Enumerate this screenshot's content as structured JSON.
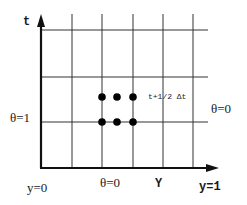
{
  "diagram": {
    "type": "finite-difference grid",
    "axes": {
      "vertical_label": "t",
      "horizontal_label": "Y"
    },
    "boundary_labels": {
      "left": "θ=1",
      "right": "θ=0",
      "bottom": "θ=0",
      "origin": "y=0",
      "end": "y=1"
    },
    "annotation": "t+1/2 Δt",
    "grid": {
      "vertical_lines_x": [
        72,
        102,
        133,
        163,
        193
      ],
      "horizontal_lines_y": [
        30,
        77,
        122
      ]
    },
    "stencil_points": [
      {
        "x": 102,
        "y": 97
      },
      {
        "x": 117,
        "y": 97
      },
      {
        "x": 133,
        "y": 97
      },
      {
        "x": 102,
        "y": 122
      },
      {
        "x": 117,
        "y": 122
      },
      {
        "x": 133,
        "y": 122
      }
    ],
    "colors": {
      "line": "#333333",
      "axis": "#111111",
      "dot": "#000000"
    }
  }
}
